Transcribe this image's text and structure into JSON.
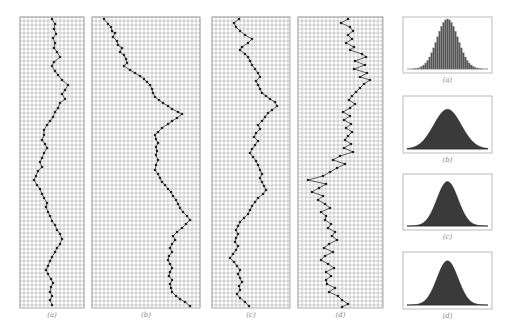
{
  "figure": {
    "grid_color": "#9a9a9a",
    "grid_cell": 4,
    "path_color": "#333333",
    "dot_color": "#222222",
    "fill_color": "#3a3a3a",
    "box_border": "#aaaaaa"
  },
  "walk_panels": [
    {
      "id": "a",
      "caption": "(a)",
      "x": 20,
      "y": 17,
      "w": 64,
      "h": 291,
      "points": [
        [
          52,
          19
        ],
        [
          55,
          24
        ],
        [
          54,
          29
        ],
        [
          56,
          34
        ],
        [
          53,
          38
        ],
        [
          55,
          43
        ],
        [
          54,
          48
        ],
        [
          57,
          52
        ],
        [
          60,
          57
        ],
        [
          54,
          62
        ],
        [
          52,
          66
        ],
        [
          55,
          71
        ],
        [
          58,
          75
        ],
        [
          62,
          80
        ],
        [
          68,
          85
        ],
        [
          65,
          90
        ],
        [
          62,
          94
        ],
        [
          65,
          99
        ],
        [
          60,
          103
        ],
        [
          58,
          108
        ],
        [
          55,
          112
        ],
        [
          53,
          117
        ],
        [
          50,
          121
        ],
        [
          47,
          125
        ],
        [
          44,
          130
        ],
        [
          44,
          135
        ],
        [
          42,
          140
        ],
        [
          45,
          144
        ],
        [
          47,
          148
        ],
        [
          44,
          153
        ],
        [
          42,
          158
        ],
        [
          40,
          162
        ],
        [
          42,
          167
        ],
        [
          38,
          171
        ],
        [
          36,
          176
        ],
        [
          34,
          180
        ],
        [
          37,
          185
        ],
        [
          40,
          189
        ],
        [
          42,
          194
        ],
        [
          44,
          198
        ],
        [
          47,
          203
        ],
        [
          46,
          207
        ],
        [
          48,
          212
        ],
        [
          50,
          216
        ],
        [
          52,
          221
        ],
        [
          55,
          225
        ],
        [
          57,
          230
        ],
        [
          60,
          234
        ],
        [
          62,
          239
        ],
        [
          60,
          244
        ],
        [
          57,
          248
        ],
        [
          55,
          252
        ],
        [
          52,
          257
        ],
        [
          50,
          261
        ],
        [
          48,
          266
        ],
        [
          46,
          270
        ],
        [
          48,
          274
        ],
        [
          51,
          279
        ],
        [
          53,
          283
        ],
        [
          51,
          287
        ],
        [
          50,
          292
        ],
        [
          52,
          296
        ],
        [
          50,
          300
        ],
        [
          52,
          305
        ]
      ]
    },
    {
      "id": "b",
      "caption": "(b)",
      "x": 92,
      "y": 17,
      "w": 108,
      "h": 291,
      "points": [
        [
          104,
          19
        ],
        [
          108,
          24
        ],
        [
          111,
          27
        ],
        [
          112,
          31
        ],
        [
          115,
          33
        ],
        [
          113,
          37
        ],
        [
          117,
          41
        ],
        [
          118,
          45
        ],
        [
          122,
          48
        ],
        [
          120,
          52
        ],
        [
          124,
          55
        ],
        [
          126,
          59
        ],
        [
          127,
          63
        ],
        [
          124,
          66
        ],
        [
          130,
          70
        ],
        [
          135,
          73
        ],
        [
          140,
          76
        ],
        [
          144,
          79
        ],
        [
          147,
          82
        ],
        [
          150,
          85
        ],
        [
          152,
          89
        ],
        [
          153,
          93
        ],
        [
          155,
          97
        ],
        [
          159,
          100
        ],
        [
          163,
          103
        ],
        [
          168,
          106
        ],
        [
          172,
          109
        ],
        [
          178,
          112
        ],
        [
          182,
          114
        ],
        [
          177,
          118
        ],
        [
          172,
          121
        ],
        [
          168,
          124
        ],
        [
          162,
          128
        ],
        [
          158,
          132
        ],
        [
          155,
          135
        ],
        [
          156,
          139
        ],
        [
          158,
          143
        ],
        [
          156,
          147
        ],
        [
          157,
          151
        ],
        [
          156,
          155
        ],
        [
          158,
          160
        ],
        [
          156,
          165
        ],
        [
          155,
          170
        ],
        [
          158,
          174
        ],
        [
          160,
          178
        ],
        [
          162,
          182
        ],
        [
          165,
          185
        ],
        [
          168,
          189
        ],
        [
          171,
          192
        ],
        [
          173,
          196
        ],
        [
          176,
          200
        ],
        [
          178,
          204
        ],
        [
          180,
          208
        ],
        [
          183,
          212
        ],
        [
          187,
          216
        ],
        [
          190,
          220
        ],
        [
          186,
          224
        ],
        [
          182,
          228
        ],
        [
          177,
          232
        ],
        [
          173,
          236
        ],
        [
          175,
          240
        ],
        [
          172,
          244
        ],
        [
          170,
          248
        ],
        [
          172,
          252
        ],
        [
          169,
          256
        ],
        [
          168,
          260
        ],
        [
          170,
          264
        ],
        [
          172,
          268
        ],
        [
          170,
          272
        ],
        [
          169,
          276
        ],
        [
          172,
          280
        ],
        [
          170,
          284
        ],
        [
          171,
          288
        ],
        [
          172,
          292
        ],
        [
          176,
          296
        ],
        [
          180,
          299
        ],
        [
          185,
          302
        ],
        [
          190,
          306
        ]
      ]
    },
    {
      "id": "c",
      "caption": "(c)",
      "x": 212,
      "y": 17,
      "w": 78,
      "h": 291,
      "points": [
        [
          239,
          19
        ],
        [
          234,
          23
        ],
        [
          236,
          27
        ],
        [
          240,
          31
        ],
        [
          245,
          35
        ],
        [
          252,
          39
        ],
        [
          248,
          43
        ],
        [
          242,
          47
        ],
        [
          240,
          50
        ],
        [
          245,
          54
        ],
        [
          248,
          57
        ],
        [
          250,
          61
        ],
        [
          252,
          65
        ],
        [
          255,
          69
        ],
        [
          258,
          73
        ],
        [
          260,
          77
        ],
        [
          256,
          81
        ],
        [
          258,
          85
        ],
        [
          260,
          89
        ],
        [
          262,
          93
        ],
        [
          266,
          96
        ],
        [
          270,
          99
        ],
        [
          275,
          102
        ],
        [
          277,
          106
        ],
        [
          272,
          110
        ],
        [
          268,
          113
        ],
        [
          265,
          117
        ],
        [
          262,
          121
        ],
        [
          258,
          125
        ],
        [
          260,
          129
        ],
        [
          256,
          133
        ],
        [
          254,
          137
        ],
        [
          258,
          141
        ],
        [
          255,
          145
        ],
        [
          252,
          149
        ],
        [
          250,
          153
        ],
        [
          253,
          157
        ],
        [
          256,
          161
        ],
        [
          258,
          165
        ],
        [
          260,
          170
        ],
        [
          262,
          174
        ],
        [
          260,
          178
        ],
        [
          262,
          182
        ],
        [
          264,
          186
        ],
        [
          266,
          190
        ],
        [
          263,
          194
        ],
        [
          258,
          198
        ],
        [
          255,
          202
        ],
        [
          252,
          206
        ],
        [
          250,
          210
        ],
        [
          248,
          214
        ],
        [
          244,
          218
        ],
        [
          240,
          222
        ],
        [
          238,
          226
        ],
        [
          236,
          230
        ],
        [
          238,
          234
        ],
        [
          236,
          238
        ],
        [
          235,
          242
        ],
        [
          238,
          246
        ],
        [
          236,
          250
        ],
        [
          233,
          254
        ],
        [
          230,
          258
        ],
        [
          234,
          262
        ],
        [
          237,
          266
        ],
        [
          240,
          270
        ],
        [
          238,
          274
        ],
        [
          240,
          278
        ],
        [
          242,
          282
        ],
        [
          239,
          286
        ],
        [
          240,
          290
        ],
        [
          237,
          294
        ],
        [
          240,
          298
        ],
        [
          245,
          302
        ],
        [
          249,
          306
        ]
      ]
    },
    {
      "id": "d",
      "caption": "(d)",
      "x": 298,
      "y": 17,
      "w": 85,
      "h": 291,
      "points": [
        [
          348,
          19
        ],
        [
          341,
          23
        ],
        [
          350,
          27
        ],
        [
          353,
          31
        ],
        [
          348,
          35
        ],
        [
          352,
          39
        ],
        [
          346,
          43
        ],
        [
          354,
          47
        ],
        [
          350,
          50
        ],
        [
          362,
          54
        ],
        [
          366,
          57
        ],
        [
          355,
          61
        ],
        [
          365,
          65
        ],
        [
          354,
          69
        ],
        [
          367,
          73
        ],
        [
          360,
          77
        ],
        [
          370,
          80
        ],
        [
          364,
          84
        ],
        [
          360,
          88
        ],
        [
          356,
          92
        ],
        [
          352,
          96
        ],
        [
          349,
          100
        ],
        [
          355,
          104
        ],
        [
          350,
          108
        ],
        [
          343,
          112
        ],
        [
          350,
          116
        ],
        [
          344,
          120
        ],
        [
          351,
          124
        ],
        [
          346,
          128
        ],
        [
          352,
          132
        ],
        [
          348,
          136
        ],
        [
          345,
          140
        ],
        [
          351,
          144
        ],
        [
          344,
          148
        ],
        [
          353,
          152
        ],
        [
          340,
          156
        ],
        [
          333,
          160
        ],
        [
          345,
          164
        ],
        [
          337,
          168
        ],
        [
          330,
          172
        ],
        [
          323,
          176
        ],
        [
          308,
          180
        ],
        [
          326,
          184
        ],
        [
          319,
          188
        ],
        [
          312,
          192
        ],
        [
          323,
          196
        ],
        [
          318,
          200
        ],
        [
          325,
          204
        ],
        [
          330,
          208
        ],
        [
          321,
          212
        ],
        [
          326,
          216
        ],
        [
          325,
          220
        ],
        [
          331,
          224
        ],
        [
          328,
          228
        ],
        [
          335,
          232
        ],
        [
          332,
          236
        ],
        [
          337,
          240
        ],
        [
          329,
          244
        ],
        [
          324,
          248
        ],
        [
          333,
          252
        ],
        [
          325,
          256
        ],
        [
          321,
          260
        ],
        [
          328,
          264
        ],
        [
          334,
          268
        ],
        [
          326,
          272
        ],
        [
          331,
          276
        ],
        [
          326,
          280
        ],
        [
          327,
          284
        ],
        [
          335,
          288
        ],
        [
          329,
          292
        ],
        [
          338,
          296
        ],
        [
          342,
          300
        ],
        [
          348,
          304
        ],
        [
          342,
          307
        ]
      ]
    }
  ],
  "bell_panels": [
    {
      "id": "a",
      "caption": "(a)",
      "x": 403,
      "y": 17,
      "w": 89,
      "h": 56,
      "style": "histogram",
      "sigma": 0.13,
      "peak": 0.9
    },
    {
      "id": "b",
      "caption": "(b)",
      "x": 403,
      "y": 96,
      "w": 89,
      "h": 57,
      "style": "filled",
      "sigma": 0.17,
      "peak": 0.7
    },
    {
      "id": "c",
      "caption": "(c)",
      "x": 403,
      "y": 174,
      "w": 89,
      "h": 56,
      "style": "filled",
      "sigma": 0.13,
      "peak": 0.8
    },
    {
      "id": "d",
      "caption": "(d)",
      "x": 403,
      "y": 252,
      "w": 89,
      "h": 57,
      "style": "filled",
      "sigma": 0.13,
      "peak": 0.78
    }
  ]
}
